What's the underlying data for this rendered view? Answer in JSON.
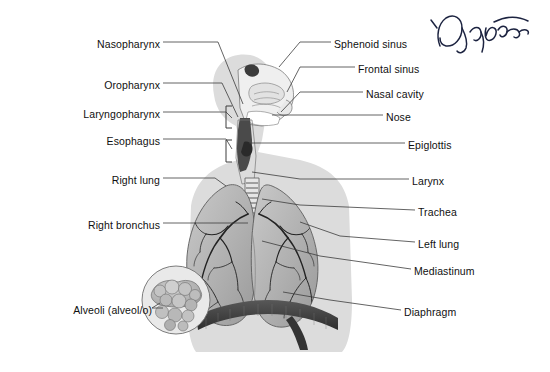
{
  "figure": {
    "orientation": "anterior body with mid-sagittal head in right profile",
    "colors": {
      "page_background": "#ffffff",
      "body_silhouette": "#dcdcdc",
      "lung_fill": "#b4b4b4",
      "bronchial_tree": "#2b2b2b",
      "diaphragm": "#3a3a3a",
      "leader_line": "#3c3c3c",
      "label_text": "#101010",
      "signature_ink": "#1c2340",
      "inset_fill": "#bdbdbd"
    }
  },
  "labels_left": [
    {
      "id": "nasopharynx",
      "text": "Nasopharynx",
      "text_x": 160,
      "text_y": 45,
      "elbow_x": 218,
      "target_x": 243,
      "target_y": 104
    },
    {
      "id": "oropharynx",
      "text": "Oropharynx",
      "text_x": 160,
      "text_y": 86,
      "elbow_x": 222,
      "target_x": 238,
      "target_y": 117
    },
    {
      "id": "laryngopharynx",
      "text": "Laryngopharynx",
      "text_x": 160,
      "text_y": 115,
      "elbow_x": 226,
      "target_x": 232,
      "target_y": 118
    },
    {
      "id": "esophagus",
      "text": "Esophagus",
      "text_x": 160,
      "text_y": 142,
      "elbow_x": 226,
      "target_x": 232,
      "target_y": 149
    },
    {
      "id": "right_lung",
      "text": "Right lung",
      "text_x": 160,
      "text_y": 181,
      "elbow_x": 215,
      "target_x": 226,
      "target_y": 186
    },
    {
      "id": "right_bronchus",
      "text": "Right bronchus",
      "text_x": 160,
      "text_y": 226,
      "elbow_x": 245,
      "target_x": 248,
      "target_y": 226
    },
    {
      "id": "alveoli",
      "text": "Alveoli (alveol/o)",
      "text_x": 160,
      "text_y": 311,
      "elbow_x": 150,
      "target_x": 160,
      "target_y": 305
    }
  ],
  "labels_right": [
    {
      "id": "sphenoid_sinus",
      "text": "Sphenoid sinus",
      "text_x": 334,
      "text_y": 45,
      "elbow_x": 326,
      "target_x": 279,
      "target_y": 67
    },
    {
      "id": "frontal_sinus",
      "text": "Frontal sinus",
      "text_x": 358,
      "text_y": 70,
      "elbow_x": 350,
      "target_x": 287,
      "target_y": 92
    },
    {
      "id": "nasal_cavity",
      "text": "Nasal cavity",
      "text_x": 366,
      "text_y": 95,
      "elbow_x": 358,
      "target_x": 281,
      "target_y": 112
    },
    {
      "id": "nose",
      "text": "Nose",
      "text_x": 386,
      "text_y": 118,
      "elbow_x": 378,
      "target_x": 272,
      "target_y": 118
    },
    {
      "id": "epiglottis",
      "text": "Epiglottis",
      "text_x": 408,
      "text_y": 146,
      "elbow_x": 400,
      "target_x": 249,
      "target_y": 146
    },
    {
      "id": "larynx",
      "text": "Larynx",
      "text_x": 412,
      "text_y": 182,
      "elbow_x": 404,
      "target_x": 252,
      "target_y": 172
    },
    {
      "id": "trachea",
      "text": "Trachea",
      "text_x": 418,
      "text_y": 213,
      "elbow_x": 410,
      "target_x": 262,
      "target_y": 199
    },
    {
      "id": "left_lung",
      "text": "Left lung",
      "text_x": 418,
      "text_y": 245,
      "elbow_x": 410,
      "target_x": 300,
      "target_y": 222
    },
    {
      "id": "mediastinum",
      "text": "Mediastinum",
      "text_x": 414,
      "text_y": 272,
      "elbow_x": 406,
      "target_x": 262,
      "target_y": 241
    },
    {
      "id": "diaphragm",
      "text": "Diaphragm",
      "text_x": 404,
      "text_y": 313,
      "elbow_x": 396,
      "target_x": 283,
      "target_y": 292
    }
  ],
  "annotation": {
    "type": "handwritten-signature",
    "description": "cursive ink signature in upper right corner",
    "x": 424,
    "y": 6,
    "width": 110,
    "height": 52
  },
  "structures": [
    "nasal cavity",
    "sphenoid sinus",
    "frontal sinus",
    "nose",
    "epiglottis",
    "nasopharynx",
    "oropharynx",
    "laryngopharynx",
    "esophagus",
    "larynx",
    "trachea",
    "right lung",
    "left lung",
    "right bronchus",
    "mediastinum",
    "diaphragm",
    "alveoli"
  ]
}
